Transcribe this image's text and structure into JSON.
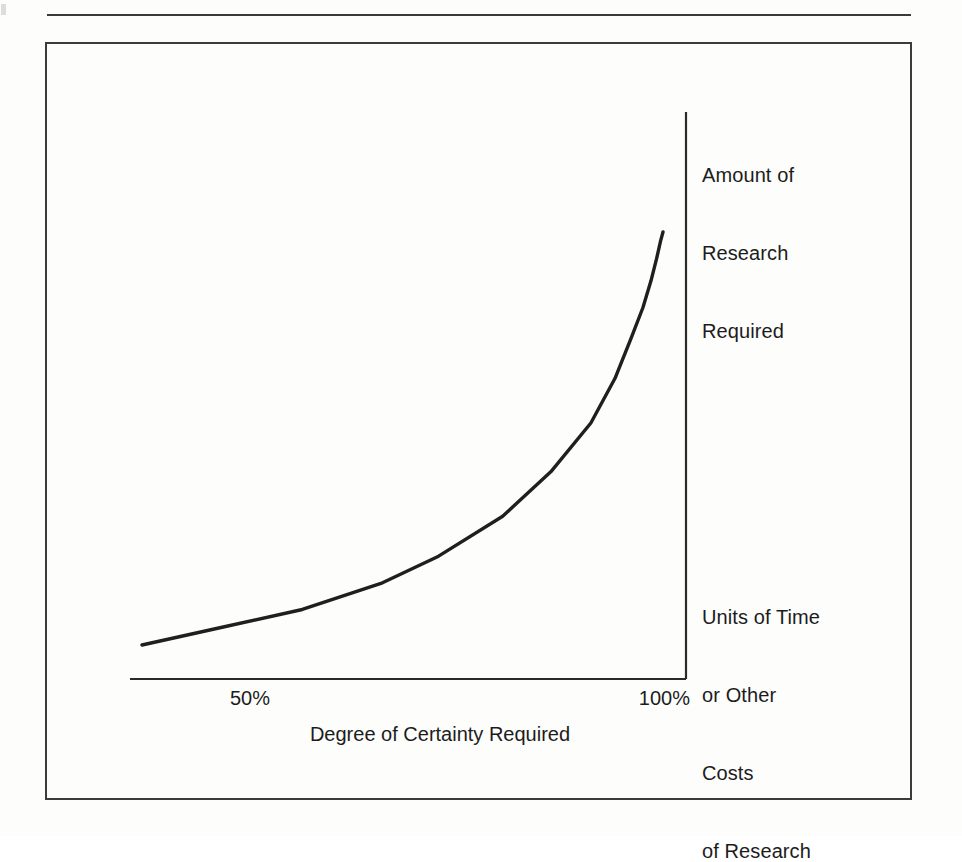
{
  "figure": {
    "page_background": "#fdfdfc",
    "ink_color": "#1c1c1c",
    "frame_color": "#3c3c3c",
    "top_rule": "horizontal-rule",
    "y_axis_top_label": {
      "line1": "Amount of",
      "line2": "Research",
      "line3": "Required"
    },
    "y_axis_bottom_label": {
      "line1": "Units of Time",
      "line2": "or Other",
      "line3": "Costs",
      "line4": "of Research"
    },
    "x_axis_title": "Degree of Certainty Required",
    "x_tick_mid": "50%",
    "x_tick_right": "100%"
  },
  "chart_data": {
    "type": "line",
    "title": "",
    "subtitle": "",
    "xlabel": "Degree of Certainty Required",
    "ylabel": "Amount of Research Required / Units of Time or Other Costs of Research",
    "xticklabels": [
      "50%",
      "100%"
    ],
    "yticklabels": [],
    "grid": false,
    "legend": false,
    "axis_style": "right-side y-axis, bottom x-axis, no tick marks",
    "xlim": [
      35,
      100
    ],
    "ylim": [
      0,
      100
    ],
    "annotations": [
      "Amount of Research Required",
      "Units of Time or Other Costs of Research"
    ],
    "series": [
      {
        "name": "Cost of certainty",
        "comment": "exponential rise: research cost grows sharply as required certainty approaches 100%",
        "x": [
          35,
          45,
          55,
          65,
          72,
          80,
          86,
          91,
          94,
          96,
          97.5,
          98.5,
          99.2,
          99.7,
          100
        ],
        "y": [
          7,
          11,
          15,
          21,
          27,
          36,
          46,
          57,
          67,
          76,
          83,
          89,
          94,
          98,
          100
        ]
      }
    ]
  }
}
